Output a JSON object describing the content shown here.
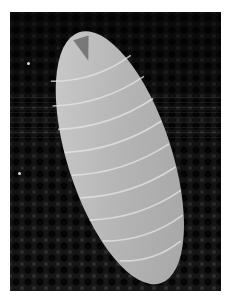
{
  "image": {
    "subject": "larva",
    "background": "dark mesh",
    "colors": {
      "page_background": "#ffffff",
      "photo_background": "#161616",
      "larva_body": "#b8b8b8",
      "larva_highlight": "#dcdcdc"
    }
  }
}
